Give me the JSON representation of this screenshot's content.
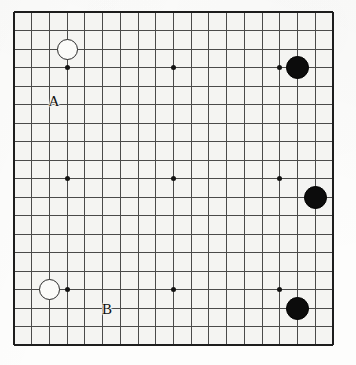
{
  "figure": {
    "kind": "go-board-diagram",
    "board_size": 19,
    "background_color": "#fcfcfb",
    "board_color": "#f4f4f2",
    "grid_color": "#4a4a4a",
    "edge_color": "#1d1d1d",
    "black_stone_color": "#0c0c0c",
    "white_stone_color": "#fbfbf9"
  },
  "board_geometry": {
    "left": 14,
    "top": 12,
    "width": 319,
    "height": 333,
    "columns": 19,
    "rows": 19,
    "col_spacing": 17.72,
    "row_spacing": 18.5,
    "line_thickness": 1,
    "edge_thickness": 2
  },
  "star_points": {
    "note": "hoshi marks",
    "dot_diameter": 5,
    "positions": [
      {
        "col": 3,
        "row": 3
      },
      {
        "col": 9,
        "row": 3
      },
      {
        "col": 15,
        "row": 3
      },
      {
        "col": 3,
        "row": 9
      },
      {
        "col": 9,
        "row": 9
      },
      {
        "col": 15,
        "row": 9
      },
      {
        "col": 3,
        "row": 15
      },
      {
        "col": 9,
        "row": 15
      },
      {
        "col": 15,
        "row": 15
      }
    ]
  },
  "stones": {
    "white_diameter": 21,
    "black_diameter": 23,
    "items": [
      {
        "color": "white",
        "col": 3,
        "row": 2,
        "label": "white-stone-upper-left"
      },
      {
        "color": "white",
        "col": 2,
        "row": 15,
        "label": "white-stone-lower-left"
      },
      {
        "color": "black",
        "col": 16,
        "row": 3,
        "label": "black-stone-upper-right"
      },
      {
        "color": "black",
        "col": 17,
        "row": 10,
        "label": "black-stone-right-side"
      },
      {
        "color": "black",
        "col": 16,
        "row": 16,
        "label": "black-stone-lower-right"
      }
    ]
  },
  "labels": [
    {
      "text": "A",
      "x": 54,
      "y": 101,
      "font_size": 15
    },
    {
      "text": "B",
      "x": 107,
      "y": 309,
      "font_size": 15
    }
  ]
}
